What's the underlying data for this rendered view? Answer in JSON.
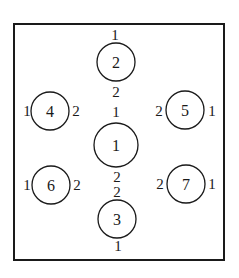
{
  "diagram": {
    "frame": {
      "x": 14,
      "y": 24,
      "w": 210,
      "h": 236
    },
    "nodes": [
      {
        "id": "2",
        "label": "2",
        "cx": 116,
        "cy": 62,
        "r": 19,
        "terminals": [
          {
            "label": "1",
            "x": 115,
            "y": 40
          },
          {
            "label": "2",
            "x": 116,
            "y": 97
          }
        ]
      },
      {
        "id": "1",
        "label": "1",
        "cx": 116,
        "cy": 145,
        "r": 22,
        "terminals": [
          {
            "label": "1",
            "x": 116,
            "y": 117
          },
          {
            "label": "2",
            "x": 117,
            "y": 180
          }
        ]
      },
      {
        "id": "3",
        "label": "3",
        "cx": 117,
        "cy": 218,
        "r": 19,
        "terminals": [
          {
            "label": "2",
            "x": 117,
            "y": 196
          },
          {
            "label": "1",
            "x": 118,
            "y": 251
          }
        ]
      },
      {
        "id": "4",
        "label": "4",
        "cx": 50,
        "cy": 110,
        "r": 19,
        "terminals": [
          {
            "label": "1",
            "x": 26,
            "y": 115
          },
          {
            "label": "2",
            "x": 76,
            "y": 115
          }
        ]
      },
      {
        "id": "5",
        "label": "5",
        "cx": 184,
        "cy": 110,
        "r": 19,
        "terminals": [
          {
            "label": "2",
            "x": 158,
            "y": 115
          },
          {
            "label": "1",
            "x": 212,
            "y": 115
          }
        ]
      },
      {
        "id": "6",
        "label": "6",
        "cx": 51,
        "cy": 185,
        "r": 19,
        "terminals": [
          {
            "label": "1",
            "x": 27,
            "y": 190
          },
          {
            "label": "2",
            "x": 77,
            "y": 190
          }
        ]
      },
      {
        "id": "7",
        "label": "7",
        "cx": 186,
        "cy": 184,
        "r": 19,
        "terminals": [
          {
            "label": "2",
            "x": 160,
            "y": 189
          },
          {
            "label": "1",
            "x": 212,
            "y": 189
          }
        ]
      }
    ],
    "colors": {
      "stroke": "#1a1a1a",
      "background": "#ffffff"
    }
  }
}
